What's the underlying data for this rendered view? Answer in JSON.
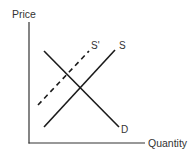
{
  "diagram": {
    "type": "supply-demand",
    "axes": {
      "y_label": "Price",
      "x_label": "Quantity"
    },
    "curves": [
      {
        "id": "D",
        "label": "D",
        "style": "solid",
        "description": "Demand curve, downward sloping"
      },
      {
        "id": "S",
        "label": "S",
        "style": "solid",
        "description": "Original supply curve, upward sloping"
      },
      {
        "id": "S_prime",
        "label": "S'",
        "style": "dashed",
        "description": "Shifted supply curve (leftward/up)"
      }
    ],
    "colors": {
      "lines": "#1a1a1a",
      "axes": "#333333",
      "text": "#333333",
      "background": "#ffffff"
    }
  }
}
